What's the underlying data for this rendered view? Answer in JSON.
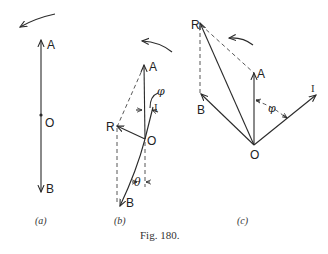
{
  "figure": {
    "caption": "Fig. 180.",
    "panels": [
      {
        "id": "a",
        "caption": "(a)",
        "labels": {
          "A": "A",
          "O": "O",
          "B": "B"
        }
      },
      {
        "id": "b",
        "caption": "(b)",
        "labels": {
          "A": "A",
          "R": "R",
          "O": "O",
          "B": "B",
          "I": "I",
          "phi": "φ",
          "theta": "θ"
        }
      },
      {
        "id": "c",
        "caption": "(c)",
        "labels": {
          "R": "R",
          "A": "A",
          "B": "B",
          "O": "O",
          "I": "I",
          "phi": "φ"
        }
      }
    ]
  }
}
